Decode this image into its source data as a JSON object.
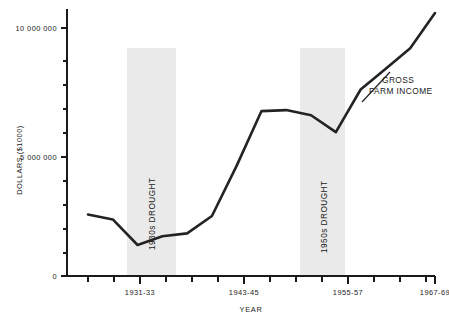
{
  "chart_data": {
    "type": "line",
    "title": "",
    "xlabel": "YEAR",
    "ylabel": "DOLLARS ($1000)",
    "grid": false,
    "legend_position": "inline-annotation",
    "ylim": [
      0,
      11200000
    ],
    "ytick_labels": [
      "0",
      "5 000 000",
      "10 000 000"
    ],
    "ytick_values": [
      0,
      5000000,
      10000000
    ],
    "ytick_minor_count": 14,
    "xtick_labels": [
      "1931-33",
      "1943-45",
      "1955-57",
      "1967-69"
    ],
    "xtick_count": 14,
    "series": [
      {
        "name": "GROSS FARM INCOME",
        "x": [
          "1925-27",
          "1928-30",
          "1931-33",
          "1934-36",
          "1937-39",
          "1940-42",
          "1943-45",
          "1946-48",
          "1949-51",
          "1952-54",
          "1955-57",
          "1958-60",
          "1961-63",
          "1964-66",
          "1967-69"
        ],
        "values": [
          2480000,
          2280000,
          1250000,
          1600000,
          1720000,
          2420000,
          4450000,
          6650000,
          6690000,
          6480000,
          5800000,
          7520000,
          8350000,
          9180000,
          10600000
        ]
      }
    ],
    "annotations": [
      {
        "text": "1930s DROUGHT",
        "orientation": "vertical",
        "type": "band-label"
      },
      {
        "text": "1950s DROUGHT",
        "orientation": "vertical",
        "type": "band-label"
      },
      {
        "text_line1": "GROSS",
        "text_line2": "FARM INCOME",
        "type": "series-callout"
      }
    ],
    "shaded_bands": [
      {
        "label": "1930s DROUGHT",
        "x_start": "1930-31",
        "x_end": "1935-36"
      },
      {
        "label": "1950s DROUGHT",
        "x_start": "1953-54",
        "x_end": "1957-58"
      }
    ],
    "colors": {
      "line": "#232323",
      "band": "#d9d9d9",
      "axis": "#1a1a1a",
      "background": "#ffffff"
    }
  }
}
